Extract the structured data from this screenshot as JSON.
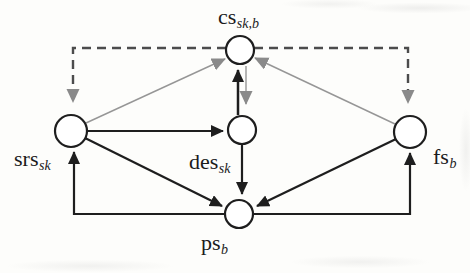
{
  "diagram": {
    "type": "directed-graph",
    "background_color": "#fdfdfb",
    "colors": {
      "node_stroke": "#1e1e1e",
      "node_fill": "#ffffff",
      "solid_edge": "#1e1e1e",
      "thin_gray_edge": "#969696",
      "dashed_edge": "#4c4c4c",
      "gray_arrowhead": "#8a8a8a",
      "black_arrowhead": "#1e1e1e"
    },
    "nodes": {
      "cs": {
        "base": "cs",
        "sub": "sk,b"
      },
      "srs": {
        "base": "srs",
        "sub": "sk"
      },
      "des": {
        "base": "des",
        "sub": "sk"
      },
      "fs": {
        "base": "fs",
        "sub": "b"
      },
      "ps": {
        "base": "ps",
        "sub": "b"
      }
    },
    "edges": [
      {
        "from": "cs",
        "to": "srs",
        "style": "dashed",
        "arrowhead": "gray",
        "route": "elbow-top-left"
      },
      {
        "from": "cs",
        "to": "fs",
        "style": "dashed",
        "arrowhead": "gray",
        "route": "elbow-top-right"
      },
      {
        "from": "srs",
        "to": "cs",
        "style": "thin-gray",
        "arrowhead": "gray",
        "route": "straight"
      },
      {
        "from": "fs",
        "to": "cs",
        "style": "thin-gray",
        "arrowhead": "gray",
        "route": "straight"
      },
      {
        "from": "cs",
        "to": "des",
        "style": "thin-gray",
        "arrowhead": "gray",
        "route": "straight"
      },
      {
        "from": "des",
        "to": "cs",
        "style": "solid-black",
        "arrowhead": "black",
        "route": "straight"
      },
      {
        "from": "srs",
        "to": "des",
        "style": "solid-black",
        "arrowhead": "black",
        "route": "straight"
      },
      {
        "from": "srs",
        "to": "ps",
        "style": "solid-black",
        "arrowhead": "black",
        "route": "straight"
      },
      {
        "from": "des",
        "to": "ps",
        "style": "solid-black",
        "arrowhead": "black",
        "route": "straight"
      },
      {
        "from": "fs",
        "to": "ps",
        "style": "solid-black",
        "arrowhead": "black",
        "route": "straight"
      },
      {
        "from": "ps",
        "to": "srs",
        "style": "solid-black",
        "arrowhead": "black",
        "route": "elbow-bottom-left"
      },
      {
        "from": "ps",
        "to": "fs",
        "style": "solid-black",
        "arrowhead": "black",
        "route": "elbow-bottom-right"
      }
    ]
  }
}
